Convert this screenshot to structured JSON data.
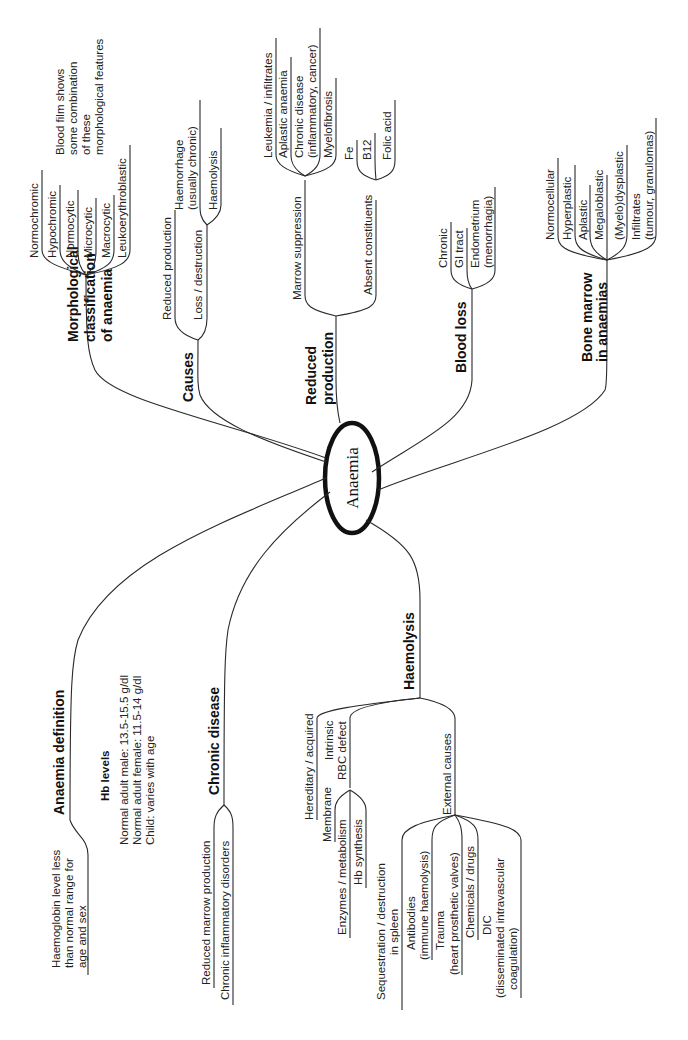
{
  "center": {
    "label": "Anaemia"
  },
  "branches": {
    "morphological": {
      "title_lines": [
        "Morphological",
        "classification",
        "of anaemia"
      ],
      "items": [
        "Normochromic",
        "Hypochromic",
        "Normocytic",
        "Microcytic",
        "Macrocytic",
        "Leukoerythroblastic"
      ],
      "note_lines": [
        "Blood film shows",
        "some combination",
        "of these",
        "morphological features"
      ]
    },
    "causes": {
      "title": "Causes",
      "items": [
        "Reduced production",
        "Loss / destruction"
      ],
      "loss_children": [
        [
          "Haemorrhage",
          "(usually chronic)"
        ],
        [
          "Haemolysis"
        ]
      ]
    },
    "reduced_production": {
      "title_lines": [
        "Reduced",
        "production"
      ],
      "marrow_suppression": {
        "label": "Marrow suppression",
        "children": [
          [
            "Leukemia / infiltrates"
          ],
          [
            "Aplastic anaemia"
          ],
          [
            "Chronic disease",
            "(inflammatory, cancer)"
          ],
          [
            "Myelofibrosis"
          ]
        ]
      },
      "absent_constituents": {
        "label": "Absent constituents",
        "children": [
          "Fe",
          "B12",
          "Folic acid"
        ]
      }
    },
    "blood_loss": {
      "title": "Blood loss",
      "children": [
        [
          "Chronic"
        ],
        [
          "GI tract"
        ],
        [
          "Endometrium",
          "(menorrhagia)"
        ]
      ]
    },
    "bone_marrow": {
      "title_lines": [
        "Bone marrow",
        "in anaemias"
      ],
      "children": [
        [
          "Normocellular"
        ],
        [
          "Hyperplastic"
        ],
        [
          "Aplastic"
        ],
        [
          "Megaloblastic"
        ],
        [
          "(Myelo)dysplastic"
        ],
        [
          "Infiltrates",
          "(tumour, granulomas)"
        ]
      ]
    },
    "definition": {
      "title": "Anaemia definition",
      "text_lines": [
        "Haemoglobin level less",
        "than normal range for",
        "age and sex"
      ],
      "hb_title": "Hb levels",
      "hb_lines": [
        "Normal adult male: 13.5-15.5 g/dl",
        "Normal adult female: 11.5-14 g/dl",
        "Child: varies with age"
      ]
    },
    "chronic_disease": {
      "title": "Chronic disease",
      "children": [
        "Reduced marrow production",
        "Chronic inflammatory disorders"
      ]
    },
    "haemolysis": {
      "title": "Haemolysis",
      "hereditary": "Hereditary / acquired",
      "intrinsic_lines": [
        "Intrinsic",
        "RBC defect"
      ],
      "intrinsic_children": [
        "Membrane",
        "Enzymes / metabolism",
        "Hb synthesis"
      ],
      "external": "External causes",
      "external_children": [
        [
          "Sequestration / destruction",
          "in spleen"
        ],
        [
          "Antibodies",
          "(immune haemolysis)"
        ],
        [
          "Trauma",
          "(heart prosthetic valves)"
        ],
        [
          "Chemicals / drugs"
        ],
        [
          "DIC",
          "(disseminated intravascular",
          "coagulation)"
        ]
      ]
    }
  }
}
